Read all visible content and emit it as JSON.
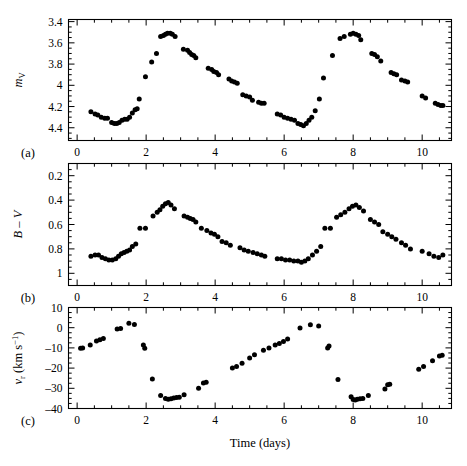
{
  "figure": {
    "xlabel": "Time (days)",
    "xlim": [
      -0.25,
      10.85
    ],
    "xticks_major": [
      0,
      2,
      4,
      6,
      8,
      10
    ],
    "xticklabels": [
      "0",
      "2",
      "4",
      "6",
      "8",
      "10"
    ],
    "xtick_minor_step": 0.5,
    "panel_labels": [
      "(a)",
      "(b)",
      "(c)"
    ],
    "point_color": "#000000",
    "frame_color": "#000000"
  },
  "chart_data": [
    {
      "type": "scatter",
      "panel": "a",
      "title": "",
      "xlabel": "",
      "ylabel": "m_V",
      "ylabel_parts": {
        "italic": "m",
        "subscript": "V"
      },
      "xlim": [
        -0.25,
        10.85
      ],
      "ylim": [
        3.38,
        4.52
      ],
      "y_inverted": true,
      "yticks": [
        3.4,
        3.6,
        3.8,
        4.0,
        4.2,
        4.4
      ],
      "yticklabels": [
        "3.4",
        "3.6",
        "3.8",
        "4",
        "4.2",
        "4.4"
      ],
      "ytick_minor_step": 0.05,
      "grid": false,
      "legend": null,
      "x": [
        0.4,
        0.52,
        0.6,
        0.7,
        0.8,
        0.88,
        1.0,
        1.08,
        1.15,
        1.22,
        1.3,
        1.38,
        1.45,
        1.52,
        1.6,
        1.68,
        1.74,
        1.8,
        1.98,
        2.16,
        2.3,
        2.42,
        2.5,
        2.56,
        2.62,
        2.7,
        2.76,
        2.84,
        3.08,
        3.2,
        3.26,
        3.32,
        3.38,
        3.44,
        3.8,
        3.9,
        3.96,
        4.04,
        4.1,
        4.4,
        4.48,
        4.56,
        4.64,
        4.8,
        4.9,
        5.0,
        5.08,
        5.26,
        5.34,
        5.42,
        5.8,
        5.9,
        6.0,
        6.1,
        6.2,
        6.3,
        6.4,
        6.48,
        6.56,
        6.64,
        6.72,
        6.8,
        6.9,
        7.02,
        7.14,
        7.4,
        7.62,
        7.74,
        7.92,
        8.0,
        8.08,
        8.16,
        8.22,
        8.54,
        8.62,
        8.7,
        8.8,
        9.1,
        9.18,
        9.26,
        9.4,
        9.5,
        9.58,
        10.0,
        10.1,
        10.38,
        10.46,
        10.54,
        10.6
      ],
      "y": [
        4.25,
        4.27,
        4.28,
        4.3,
        4.31,
        4.31,
        4.35,
        4.36,
        4.36,
        4.35,
        4.33,
        4.32,
        4.32,
        4.3,
        4.26,
        4.23,
        4.22,
        4.13,
        3.92,
        3.78,
        3.7,
        3.54,
        3.53,
        3.52,
        3.51,
        3.51,
        3.52,
        3.54,
        3.66,
        3.67,
        3.69,
        3.71,
        3.72,
        3.74,
        3.84,
        3.85,
        3.87,
        3.88,
        3.9,
        3.94,
        3.96,
        3.97,
        3.98,
        4.09,
        4.1,
        4.11,
        4.14,
        4.16,
        4.17,
        4.17,
        4.27,
        4.28,
        4.3,
        4.31,
        4.32,
        4.33,
        4.36,
        4.37,
        4.38,
        4.36,
        4.33,
        4.3,
        4.24,
        4.13,
        3.93,
        3.72,
        3.56,
        3.54,
        3.52,
        3.51,
        3.52,
        3.53,
        3.57,
        3.7,
        3.71,
        3.73,
        3.77,
        3.88,
        3.89,
        3.9,
        3.95,
        3.96,
        3.97,
        4.1,
        4.12,
        4.17,
        4.18,
        4.19,
        4.19
      ]
    },
    {
      "type": "scatter",
      "panel": "b",
      "title": "",
      "xlabel": "",
      "ylabel": "B – V",
      "xlim": [
        -0.25,
        10.85
      ],
      "ylim": [
        0.1,
        1.1
      ],
      "y_inverted": true,
      "yticks": [
        0.2,
        0.4,
        0.6,
        0.8,
        1.0
      ],
      "yticklabels": [
        "0.2",
        "0.4",
        "0.6",
        "0.8",
        "1"
      ],
      "ytick_minor_step": 0.05,
      "grid": false,
      "legend": null,
      "x": [
        0.4,
        0.52,
        0.62,
        0.72,
        0.82,
        0.92,
        1.02,
        1.12,
        1.2,
        1.28,
        1.36,
        1.44,
        1.52,
        1.6,
        1.7,
        1.82,
        1.98,
        2.2,
        2.32,
        2.4,
        2.48,
        2.56,
        2.64,
        2.72,
        2.82,
        3.1,
        3.2,
        3.28,
        3.36,
        3.44,
        3.6,
        3.76,
        3.88,
        3.98,
        4.08,
        4.2,
        4.32,
        4.44,
        4.72,
        4.84,
        4.96,
        5.1,
        5.22,
        5.34,
        5.44,
        5.8,
        5.92,
        6.04,
        6.16,
        6.28,
        6.4,
        6.5,
        6.6,
        6.7,
        6.82,
        6.94,
        7.06,
        7.18,
        7.34,
        7.52,
        7.64,
        7.76,
        7.88,
        7.98,
        8.08,
        8.18,
        8.3,
        8.5,
        8.62,
        8.74,
        8.86,
        9.0,
        9.12,
        9.24,
        9.4,
        9.52,
        9.66,
        10.0,
        10.2,
        10.34,
        10.48,
        10.6
      ],
      "y": [
        0.86,
        0.85,
        0.85,
        0.87,
        0.88,
        0.89,
        0.89,
        0.88,
        0.86,
        0.84,
        0.83,
        0.82,
        0.81,
        0.78,
        0.76,
        0.63,
        0.63,
        0.53,
        0.5,
        0.48,
        0.45,
        0.43,
        0.42,
        0.44,
        0.47,
        0.53,
        0.54,
        0.55,
        0.56,
        0.58,
        0.63,
        0.65,
        0.67,
        0.68,
        0.7,
        0.74,
        0.75,
        0.77,
        0.79,
        0.81,
        0.82,
        0.83,
        0.84,
        0.85,
        0.86,
        0.88,
        0.88,
        0.89,
        0.89,
        0.9,
        0.9,
        0.91,
        0.9,
        0.88,
        0.85,
        0.82,
        0.78,
        0.63,
        0.63,
        0.54,
        0.52,
        0.5,
        0.47,
        0.45,
        0.44,
        0.46,
        0.49,
        0.56,
        0.58,
        0.6,
        0.66,
        0.68,
        0.7,
        0.72,
        0.75,
        0.77,
        0.8,
        0.82,
        0.84,
        0.86,
        0.87,
        0.85
      ]
    },
    {
      "type": "scatter",
      "panel": "c",
      "title": "",
      "xlabel": "Time (days)",
      "ylabel": "v_r (km s^-1)",
      "ylabel_parts": {
        "italic": "v",
        "subscript": "r",
        "rest": "(km s",
        "sup": "-1",
        "close": ")"
      },
      "xlim": [
        -0.25,
        10.85
      ],
      "ylim": [
        -40,
        10
      ],
      "y_inverted": false,
      "yticks": [
        10,
        0,
        -10,
        -20,
        -30,
        -40
      ],
      "yticklabels": [
        "10",
        "0",
        "-10",
        "-20",
        "-30",
        "-40"
      ],
      "ytick_minor_step": 2.5,
      "grid": false,
      "legend": null,
      "x": [
        0.1,
        0.16,
        0.38,
        0.56,
        0.66,
        0.76,
        1.16,
        1.26,
        1.5,
        1.66,
        1.92,
        1.96,
        2.18,
        2.42,
        2.56,
        2.64,
        2.72,
        2.8,
        2.88,
        2.96,
        3.1,
        3.52,
        3.66,
        3.74,
        4.5,
        4.62,
        4.78,
        5.0,
        5.14,
        5.4,
        5.56,
        5.74,
        5.86,
        5.98,
        6.1,
        6.46,
        6.76,
        7.0,
        7.26,
        7.3,
        7.56,
        7.94,
        8.0,
        8.06,
        8.12,
        8.2,
        8.28,
        8.44,
        8.92,
        9.0,
        9.06,
        9.9,
        10.04,
        10.3,
        10.5,
        10.58
      ],
      "y": [
        -10.2,
        -10.0,
        -8.6,
        -6.6,
        -6.0,
        -5.4,
        -0.6,
        -0.4,
        2.2,
        1.6,
        -8.6,
        -10.2,
        -25.4,
        -33.6,
        -35.0,
        -35.4,
        -35.2,
        -34.8,
        -34.6,
        -34.4,
        -33.2,
        -30.0,
        -27.4,
        -27.0,
        -20.0,
        -19.2,
        -17.6,
        -15.0,
        -13.4,
        -11.2,
        -10.0,
        -8.6,
        -7.8,
        -6.8,
        -5.6,
        -0.2,
        1.4,
        0.8,
        -10.0,
        -9.0,
        -25.6,
        -34.2,
        -35.6,
        -35.8,
        -35.4,
        -35.2,
        -35.0,
        -33.6,
        -30.4,
        -28.2,
        -28.0,
        -20.6,
        -19.2,
        -16.4,
        -14.0,
        -13.6
      ]
    }
  ]
}
